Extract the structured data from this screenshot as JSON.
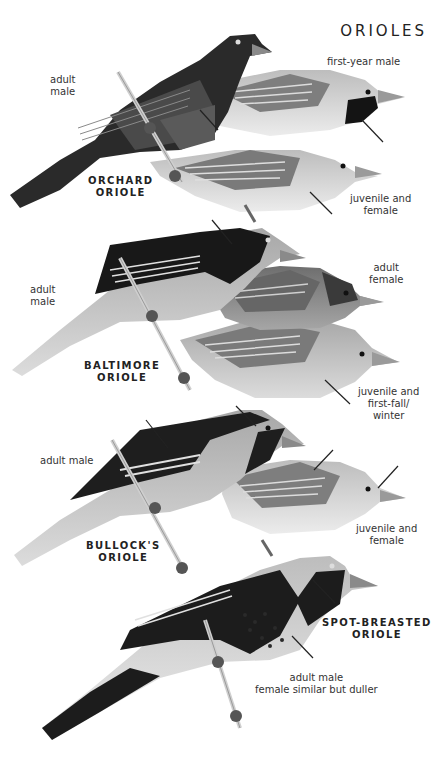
{
  "page": {
    "title": "ORIOLES"
  },
  "species": [
    {
      "name_line1": "ORCHARD",
      "name_line2": "ORIOLE",
      "labels": [
        {
          "line1": "adult",
          "line2": "male"
        },
        {
          "line1": "first-year male",
          "line2": ""
        },
        {
          "line1": "juvenile and",
          "line2": "female"
        }
      ]
    },
    {
      "name_line1": "BALTIMORE",
      "name_line2": "ORIOLE",
      "labels": [
        {
          "line1": "adult",
          "line2": "male"
        },
        {
          "line1": "adult",
          "line2": "female"
        },
        {
          "line1": "juvenile and",
          "line2": "first-fall/",
          "line3": "winter"
        }
      ]
    },
    {
      "name_line1": "BULLOCK'S",
      "name_line2": "ORIOLE",
      "labels": [
        {
          "line1": "adult male",
          "line2": ""
        },
        {
          "line1": "juvenile and",
          "line2": "female"
        }
      ]
    },
    {
      "name_line1": "SPOT-BREASTED",
      "name_line2": "ORIOLE",
      "labels": [
        {
          "line1": "adult male",
          "line2": "female similar but duller"
        }
      ]
    }
  ],
  "colors": {
    "background": "#ffffff",
    "text": "#2b2b2b",
    "black_plumage": "#1c1c1c",
    "mid_plumage": "#8a8a8a",
    "light_plumage": "#c9c9c9",
    "pale_plumage": "#e4e4e4"
  }
}
